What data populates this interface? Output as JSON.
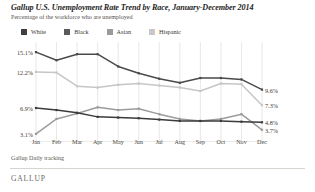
{
  "header": {
    "title": "Gallup U.S. Unemployment Rate Trend by Race, January-December 2014",
    "subtitle": "Percentage of the workforce who are unemployed"
  },
  "footer": {
    "source": "Gallup Daily tracking",
    "brand": "GALLUP"
  },
  "legend": {
    "position": "top-left",
    "items": [
      {
        "label": "White",
        "color": "#3f3f3f"
      },
      {
        "label": "Black",
        "color": "#5a5a5a"
      },
      {
        "label": "Asian",
        "color": "#9a9a9a"
      },
      {
        "label": "Hispanic",
        "color": "#c8c8c8"
      }
    ]
  },
  "chart_data": {
    "type": "line",
    "title": "Gallup U.S. Unemployment Rate Trend by Race, January-December 2014",
    "subtitle": "Percentage of the workforce who are unemployed",
    "xlabel": "",
    "ylabel": "",
    "ylim": [
      2.5,
      16.0
    ],
    "grid": "vertical",
    "legend_position": "top-left",
    "categories": [
      "Jan",
      "Feb",
      "Mar",
      "Apr",
      "May",
      "Jun",
      "Jul",
      "Aug",
      "Sep",
      "Oct",
      "Nov",
      "Dec"
    ],
    "series": [
      {
        "name": "Black",
        "color": "#4a4a4a",
        "values": [
          15.1,
          13.9,
          14.8,
          14.8,
          13.0,
          12.0,
          11.2,
          10.6,
          11.3,
          11.3,
          11.1,
          9.6
        ],
        "start_label": "15.1%",
        "end_label": "9.6%"
      },
      {
        "name": "Hispanic",
        "color": "#c6c6c6",
        "values": [
          12.2,
          12.1,
          10.1,
          9.9,
          10.3,
          10.5,
          10.2,
          9.9,
          9.4,
          10.5,
          10.4,
          7.3
        ],
        "start_label": "12.2%",
        "end_label": "7.3%"
      },
      {
        "name": "White",
        "color": "#3b3b3b",
        "values": [
          6.9,
          6.6,
          6.2,
          5.6,
          5.5,
          5.4,
          5.2,
          5.0,
          5.0,
          5.0,
          4.9,
          4.8
        ],
        "start_label": "6.9%",
        "end_label": "4.8%"
      },
      {
        "name": "Asian",
        "color": "#9c9c9c",
        "values": [
          3.1,
          5.3,
          6.1,
          7.0,
          6.6,
          6.8,
          6.0,
          5.3,
          5.0,
          5.3,
          6.0,
          3.7
        ],
        "start_label": "3.1%",
        "end_label": "3.7%"
      }
    ],
    "edge_labels": {
      "left": [
        {
          "text": "15.1%",
          "value": 15.1
        },
        {
          "text": "12.2%",
          "value": 12.2
        },
        {
          "text": "6.9%",
          "value": 6.9
        },
        {
          "text": "3.1%",
          "value": 3.1
        }
      ],
      "right": [
        {
          "text": "9.6%",
          "value": 9.6
        },
        {
          "text": "7.3%",
          "value": 7.3
        },
        {
          "text": "4.8%",
          "value": 4.8
        },
        {
          "text": "3.7%",
          "value": 3.7
        }
      ]
    }
  }
}
